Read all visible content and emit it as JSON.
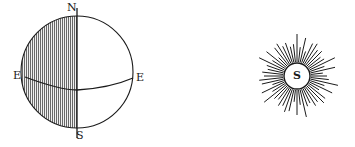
{
  "globe": {
    "labels": {
      "north": "N",
      "south": "S",
      "east_left": "E",
      "east_right": "E"
    },
    "shaded_half": "left",
    "ink_color": "#1a1a1a",
    "shade_color": "#8a8a8a"
  },
  "sun": {
    "label": "S",
    "ray_count": 56
  }
}
